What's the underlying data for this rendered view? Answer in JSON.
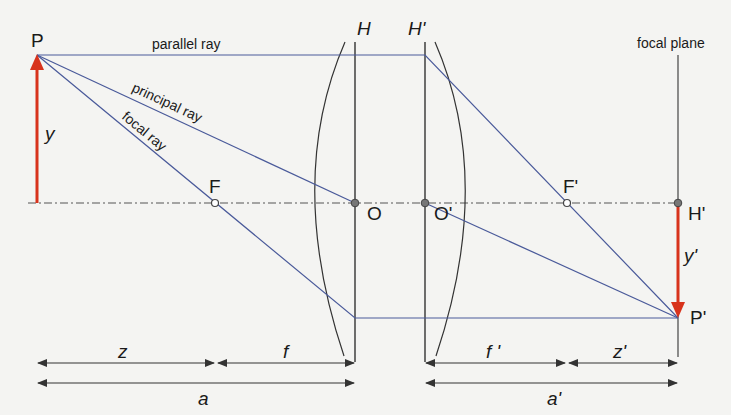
{
  "diagram": {
    "colors": {
      "ray": "#4a5a9a",
      "object_arrow": "#d8331c",
      "line": "#333333",
      "axis": "#555555",
      "background": "#f4f4f2"
    },
    "labels": {
      "object_point": "P",
      "image_point": "P'",
      "object_height": "y",
      "image_height": "y'",
      "front_focus": "F",
      "back_focus": "F'",
      "front_nodal": "O",
      "back_nodal": "O'",
      "front_principal_plane": "H",
      "back_principal_plane": "H'",
      "image_principal_point": "H'",
      "focal_plane": "focal plane"
    },
    "rays": {
      "parallel": "parallel ray",
      "principal": "principal ray",
      "focal": "focal ray"
    },
    "dimensions": {
      "z": "z",
      "f": "f",
      "a": "a",
      "f_prime": "f '",
      "z_prime": "z'",
      "a_prime": "a'"
    }
  }
}
